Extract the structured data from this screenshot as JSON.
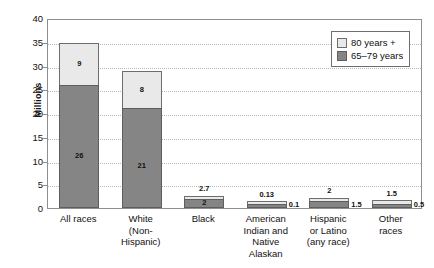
{
  "chart_data": {
    "type": "bar",
    "subtype": "stacked-bar",
    "title": "",
    "xlabel": "",
    "ylabel": "Millions",
    "ylim": [
      0,
      40
    ],
    "yticks": [
      0,
      5,
      10,
      15,
      20,
      25,
      30,
      35,
      40
    ],
    "grid": true,
    "legend_position": "top-right",
    "categories": [
      "All races",
      "White (Non-Hispanic)",
      "Black",
      "American Indian and Native Alaskan",
      "Hispanic or Latino (any race)",
      "Other races"
    ],
    "series": [
      {
        "name": "65–79 years",
        "color": "#858585",
        "values": [
          26,
          21,
          2,
          0.1,
          1.5,
          0.5
        ]
      },
      {
        "name": "80 years +",
        "color": "#e9e9e9",
        "values": [
          9,
          8,
          0.7,
          0.03,
          0.5,
          1.0
        ]
      }
    ],
    "totals": [
      35,
      29,
      2.7,
      0.13,
      2,
      1.5
    ],
    "annotations": [
      "26",
      "9",
      "21",
      "8",
      "2.7",
      "2",
      "0.13",
      "0.1",
      "2",
      "1.5",
      "1.5",
      "0.5"
    ]
  },
  "axis": {
    "y_title": "Millions",
    "y_ticks": [
      "40",
      "35",
      "30",
      "25",
      "20",
      "15",
      "10",
      "5",
      "0"
    ]
  },
  "legend": {
    "items": [
      {
        "label": "80 years +",
        "swatch": "light"
      },
      {
        "label": "65–79 years",
        "swatch": "dark"
      }
    ]
  },
  "bars": [
    {
      "key": "all-races",
      "x_lines": [
        "All races"
      ],
      "top_value": 9,
      "bottom_value": 26,
      "total": 35,
      "top_label": "9",
      "bottom_label": "26",
      "label_mode": "inside"
    },
    {
      "key": "white-non-hispanic",
      "x_lines": [
        "White",
        "(Non-Hispanic)"
      ],
      "top_value": 8,
      "bottom_value": 21,
      "total": 29,
      "top_label": "8",
      "bottom_label": "21",
      "label_mode": "inside"
    },
    {
      "key": "black",
      "x_lines": [
        "Black"
      ],
      "top_value": 0.7,
      "bottom_value": 2,
      "total": 2.7,
      "top_label": "2.7",
      "bottom_label": "2",
      "label_mode": "above-inside"
    },
    {
      "key": "american-indian-native-alaskan",
      "x_lines": [
        "American",
        "Indian and",
        "Native",
        "Alaskan"
      ],
      "top_value": 0.03,
      "bottom_value": 0.1,
      "total": 0.13,
      "top_label": "0.13",
      "bottom_label": "0.1",
      "label_mode": "above-right"
    },
    {
      "key": "hispanic-or-latino",
      "x_lines": [
        "Hispanic",
        "or Latino",
        "(any race)"
      ],
      "top_value": 0.5,
      "bottom_value": 1.5,
      "total": 2,
      "top_label": "2",
      "bottom_label": "1.5",
      "label_mode": "above-right"
    },
    {
      "key": "other-races",
      "x_lines": [
        "Other",
        "races"
      ],
      "top_value": 1.0,
      "bottom_value": 0.5,
      "total": 1.5,
      "top_label": "1.5",
      "bottom_label": "0.5",
      "label_mode": "above-right"
    }
  ],
  "colors": {
    "series_80_plus": "#e9e9e9",
    "series_65_79": "#858585",
    "axis": "#8e8e8e",
    "grid": "#b9b9b9",
    "text": "#111111",
    "background": "#ffffff"
  }
}
